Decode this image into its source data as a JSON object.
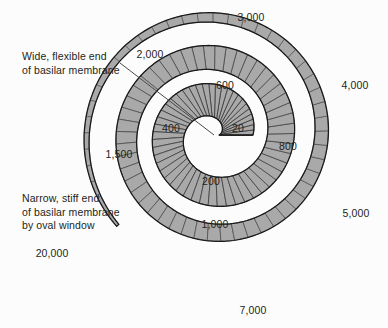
{
  "figure": {
    "name": "cochlea-tonotopic-map",
    "background_color": "#fcfcfc",
    "segment_fill": "#a9a9a9",
    "segment_stroke": "#3a3a3a",
    "outline_color": "#1a1a1a",
    "text_color": "#231f20",
    "leader_line_color": "#4a4a4a"
  },
  "callouts": [
    {
      "id": "wide-flexible-end",
      "lines": [
        "Wide, flexible end",
        "of basilar membrane"
      ],
      "line1": "Wide, flexible end",
      "line2": "of basilar membrane",
      "x": 22,
      "y": 50
    },
    {
      "id": "narrow-stiff-end",
      "lines": [
        "Narrow, stiff end",
        "of basilar membrane",
        "by oval window"
      ],
      "line1": "Narrow, stiff end",
      "line2": "of basilar membrane",
      "line3": "by oval window",
      "x": 22,
      "y": 192
    }
  ],
  "leader_line": {
    "x1": 120,
    "y1": 63,
    "x2": 214,
    "y2": 135
  },
  "frequency_labels": [
    {
      "id": "f-20",
      "text": "20",
      "x": 232,
      "y": 129,
      "anchor": "start"
    },
    {
      "id": "f-200",
      "text": "200",
      "x": 211,
      "y": 182,
      "anchor": "middle"
    },
    {
      "id": "f-400",
      "text": "400",
      "x": 171,
      "y": 129,
      "anchor": "middle"
    },
    {
      "id": "f-600",
      "text": "600",
      "x": 225,
      "y": 86,
      "anchor": "middle"
    },
    {
      "id": "f-800",
      "text": "800",
      "x": 288,
      "y": 147,
      "anchor": "middle"
    },
    {
      "id": "f-1000",
      "text": "1,000",
      "x": 215,
      "y": 225,
      "anchor": "middle"
    },
    {
      "id": "f-1500",
      "text": "1,500",
      "x": 119,
      "y": 155,
      "anchor": "middle"
    },
    {
      "id": "f-2000",
      "text": "2,000",
      "x": 150,
      "y": 55,
      "anchor": "middle"
    },
    {
      "id": "f-3000",
      "text": "3,000",
      "x": 251,
      "y": 18,
      "anchor": "middle"
    },
    {
      "id": "f-4000",
      "text": "4,000",
      "x": 355,
      "y": 86,
      "anchor": "middle"
    },
    {
      "id": "f-5000",
      "text": "5,000",
      "x": 356,
      "y": 214,
      "anchor": "middle"
    },
    {
      "id": "f-7000",
      "text": "7,000",
      "x": 253,
      "y": 311,
      "anchor": "middle"
    },
    {
      "id": "f-20000",
      "text": "20,000",
      "x": 52,
      "y": 254,
      "anchor": "middle"
    }
  ],
  "chart_data": {
    "type": "diagram",
    "subtype": "cochlea-spiral-tonotopic-map",
    "title": "",
    "unit": "Hz",
    "frequencies": [
      20,
      200,
      400,
      600,
      800,
      1000,
      1500,
      2000,
      3000,
      4000,
      5000,
      7000,
      20000
    ],
    "annotations": [
      "Wide, flexible end of basilar membrane",
      "Narrow, stiff end of basilar membrane by oval window"
    ],
    "spiral": {
      "center_x": 214,
      "center_y": 135,
      "turns": 2.62,
      "theta_start_deg": 0,
      "inner_radius": 22,
      "outer_radius": 132,
      "band_width_start": 34,
      "band_width_end": 3,
      "segment_count": 128
    }
  }
}
